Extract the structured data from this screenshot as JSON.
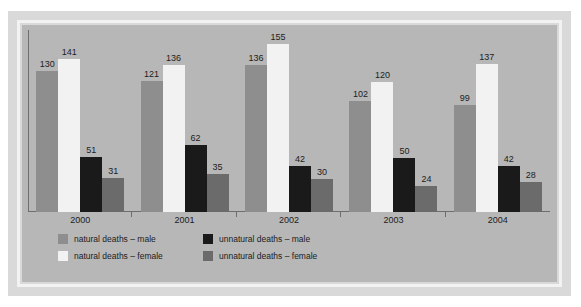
{
  "chart_data": {
    "type": "bar",
    "title": "",
    "subtitle": "",
    "xlabel": "",
    "ylabel": "",
    "categories": [
      "2000",
      "2001",
      "2002",
      "2003",
      "2004"
    ],
    "ylim": [
      0,
      155
    ],
    "grid": false,
    "legend_position": "bottom",
    "series": [
      {
        "name": "natural deaths – male",
        "color": "#8e8e8e",
        "values": [
          130,
          121,
          136,
          102,
          99
        ]
      },
      {
        "name": "natural deaths – female",
        "color": "#f2f2f2",
        "values": [
          141,
          136,
          155,
          120,
          137
        ]
      },
      {
        "name": "unnatural deaths – male",
        "color": "#1a1a1a",
        "values": [
          51,
          62,
          42,
          50,
          42
        ]
      },
      {
        "name": "unnatural deaths – female",
        "color": "#6b6b6b",
        "values": [
          31,
          35,
          30,
          24,
          28
        ]
      }
    ]
  },
  "colors": {
    "panel_background": "#b7b7b7",
    "mount_background": "#d9d9d9",
    "frame": "#f2f2f2",
    "axis": "#6e6e6e",
    "text": "#1c1c1c"
  }
}
